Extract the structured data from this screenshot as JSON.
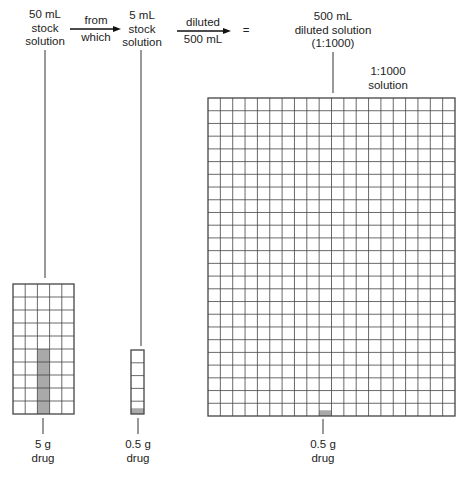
{
  "labels": {
    "stock50": [
      "50 mL",
      "stock",
      "solution"
    ],
    "from_which": [
      "from",
      "which"
    ],
    "stock5": [
      "5 mL",
      "stock",
      "solution"
    ],
    "diluted": [
      "diluted",
      "500 mL"
    ],
    "equals": "=",
    "diluted500": [
      "500 mL",
      "diluted solution",
      "(1:1000)"
    ],
    "ratio": [
      "1:1000",
      "solution"
    ],
    "drug5": [
      "5 g",
      "drug"
    ],
    "drug05a": [
      "0.5 g",
      "drug"
    ],
    "drug05b": [
      "0.5 g",
      "drug"
    ]
  },
  "colors": {
    "line": "#333333",
    "grid": "#444444",
    "shade": "#a9a9a9"
  },
  "grids": [
    {
      "name": "grid-50ml",
      "x": 13,
      "y": 284,
      "cols": 5,
      "rows": 10,
      "cw": 12.2,
      "ch": 13,
      "shaded": [
        {
          "col": 2,
          "row": 5,
          "h": 1
        },
        {
          "col": 2,
          "row": 6,
          "h": 1
        },
        {
          "col": 2,
          "row": 7,
          "h": 1
        },
        {
          "col": 2,
          "row": 8,
          "h": 1
        },
        {
          "col": 2,
          "row": 9,
          "h": 1
        }
      ]
    },
    {
      "name": "grid-5ml",
      "x": 131,
      "y": 350,
      "cols": 1,
      "rows": 5,
      "cw": 13,
      "ch": 12.8,
      "shaded": [
        {
          "col": 0,
          "row": 4,
          "h": 0.45
        }
      ]
    },
    {
      "name": "grid-500ml",
      "x": 208,
      "y": 98,
      "cols": 20,
      "rows": 25,
      "cw": 12.35,
      "ch": 12.72,
      "shaded": [
        {
          "col": 9,
          "row": 24,
          "h": 0.45
        }
      ]
    }
  ],
  "connectors": [
    {
      "x1": 45,
      "y1": 50,
      "x2": 45,
      "y2": 278
    },
    {
      "x1": 141,
      "y1": 50,
      "x2": 141,
      "y2": 346
    },
    {
      "x1": 333,
      "y1": 52,
      "x2": 333,
      "y2": 93
    },
    {
      "x1": 43,
      "y1": 418,
      "x2": 43,
      "y2": 434
    },
    {
      "x1": 138,
      "y1": 418,
      "x2": 138,
      "y2": 434
    },
    {
      "x1": 323,
      "y1": 419,
      "x2": 323,
      "y2": 434
    }
  ],
  "arrows": [
    {
      "x1": 70,
      "y1": 29,
      "x2": 121,
      "y2": 29
    },
    {
      "x1": 177,
      "y1": 31,
      "x2": 231,
      "y2": 31
    }
  ]
}
